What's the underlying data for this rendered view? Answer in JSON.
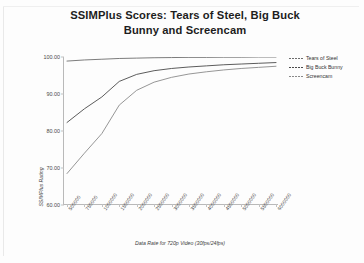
{
  "chart_data": {
    "type": "line",
    "title": "SSIMPlus Scores: Tears of Steel, Big Buck Bunny and Screencam",
    "xlabel": "Data Rate for 720p Video (30fps/24fps)",
    "ylabel": "SSIMPlus Rating",
    "grid": false,
    "legend_position": "right",
    "ylim": [
      60.0,
      100.0
    ],
    "yticks": [
      "60.00",
      "70.00",
      "80.00",
      "90.00",
      "100.00"
    ],
    "ytick_values": [
      60.0,
      70.0,
      80.0,
      90.0,
      100.0
    ],
    "categories": [
      "500000",
      "750000",
      "1000000",
      "1500000",
      "2000000",
      "2500000",
      "3000000",
      "3500000",
      "4000000",
      "4500000",
      "5000000",
      "5500000",
      "6000000"
    ],
    "series": [
      {
        "name": "Tears of Steel",
        "color": "#6d6d6d",
        "values": [
          98.9,
          99.2,
          99.4,
          99.6,
          99.7,
          99.8,
          99.85,
          99.9,
          99.9,
          99.95,
          99.95,
          100.0,
          100.0
        ]
      },
      {
        "name": "Big Buck Bunny",
        "color": "#4a4a4a",
        "values": [
          82.3,
          86.0,
          89.2,
          93.4,
          95.3,
          96.3,
          96.9,
          97.3,
          97.6,
          97.9,
          98.1,
          98.3,
          98.5
        ]
      },
      {
        "name": "Screencam",
        "color": "#8a8a8a",
        "values": [
          68.5,
          74.0,
          79.3,
          87.0,
          91.0,
          93.2,
          94.5,
          95.4,
          96.0,
          96.5,
          96.9,
          97.2,
          97.5
        ]
      }
    ]
  }
}
